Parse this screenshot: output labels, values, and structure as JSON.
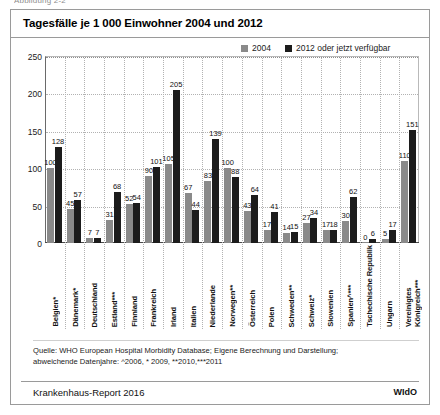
{
  "figure_caption": "Abbildung 2-2",
  "header": {
    "title": "Tagesfälle je 1 000 Einwohner 2004 und 2012"
  },
  "legend": {
    "items": [
      {
        "label": "2004",
        "color": "#8a8a8a",
        "swatch_name": "legend-swatch-2004"
      },
      {
        "label": "2012 oder jetzt verfügbar",
        "color": "#1c1c1c",
        "swatch_name": "legend-swatch-2012"
      }
    ]
  },
  "source": {
    "line1": "Quelle: WHO European Hospital Morbidity Database; Eigene Berechnung und Darstellung;",
    "line2": "abweichende Datenjahre: ^2006, * 2009, **2010,***2011"
  },
  "footer": {
    "left": "Krankenhaus-Report 2016",
    "right": "WIdO"
  },
  "chart_data": {
    "type": "bar",
    "title": "Tagesfälle je 1 000 Einwohner 2004 und 2012",
    "xlabel": "",
    "ylabel": "",
    "ylim": [
      0,
      250
    ],
    "yticks": [
      0,
      50,
      100,
      150,
      200,
      250
    ],
    "ytick_labels": [
      "0",
      "50",
      "100",
      "150",
      "200",
      "250"
    ],
    "grid": "horizontal-dotted + vertical-dotted category separators",
    "legend_position": "top-right",
    "categories": [
      "Belgien*",
      "Dänemark*",
      "Deutschland",
      "Estland***",
      "Finnland",
      "Frankreich",
      "Irland",
      "Italien",
      "Niederlande",
      "Norwegen**",
      "Österreich",
      "Polen",
      "Schweden**",
      "Schweiz*",
      "Slowenien",
      "Spanien^***",
      "Tschechische Republik",
      "Ungarn",
      "Vereinigtes Königreich***"
    ],
    "series": [
      {
        "name": "2004",
        "color": "#8a8a8a",
        "values": [
          100,
          45,
          7,
          31,
          52,
          90,
          105,
          67,
          83,
          100,
          43,
          17,
          14,
          27,
          17,
          30,
          0,
          5,
          110
        ]
      },
      {
        "name": "2012 oder jetzt verfügbar",
        "color": "#1c1c1c",
        "values": [
          128,
          57,
          7,
          68,
          54,
          101,
          205,
          44,
          139,
          88,
          64,
          41,
          15,
          34,
          18,
          62,
          6,
          17,
          151
        ]
      }
    ]
  }
}
